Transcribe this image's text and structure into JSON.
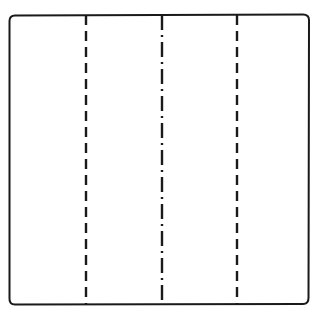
{
  "diagram": {
    "type": "paper-fold-diagram",
    "background": "#ffffff",
    "stroke_color": "#1a1a1a",
    "sheet": {
      "shape": "square",
      "x": 9,
      "y": 15,
      "width": 300,
      "height": 289,
      "corner_radius": 6
    },
    "fold_lines": [
      {
        "id": "left",
        "orientation": "vertical",
        "x": 86,
        "style": "dashed",
        "meaning": "valley-fold"
      },
      {
        "id": "center",
        "orientation": "vertical",
        "x": 162,
        "style": "dash-dot",
        "meaning": "mountain-fold"
      },
      {
        "id": "right",
        "orientation": "vertical",
        "x": 237,
        "style": "dashed",
        "meaning": "valley-fold"
      }
    ]
  }
}
